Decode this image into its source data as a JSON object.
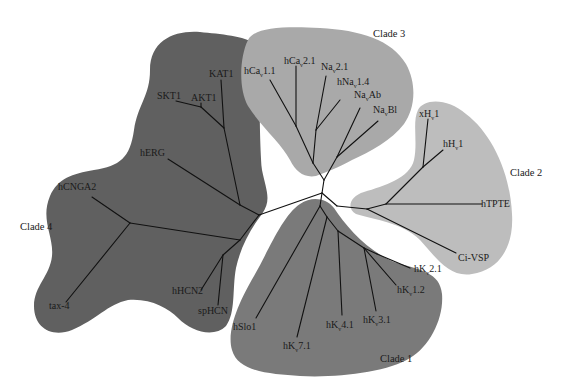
{
  "diagram": {
    "type": "unrooted phylogenetic tree",
    "colors": {
      "clade_1": "#7a7a7a",
      "clade_2": "#bdbdbd",
      "clade_3": "#a9a9a9",
      "clade_4": "#606060",
      "branch": "#111111",
      "background": "#ffffff"
    },
    "clades": [
      {
        "id": "clade_1",
        "label": "Clade 1",
        "leaves": [
          {
            "id": "hslo1",
            "base": "hSlo1",
            "sub": "",
            "rest": ""
          },
          {
            "id": "hkv7_1",
            "base": "hK",
            "sub": "v",
            "rest": "7.1"
          },
          {
            "id": "hkv4_1",
            "base": "hK",
            "sub": "v",
            "rest": "4.1"
          },
          {
            "id": "hkv3_1",
            "base": "hK",
            "sub": "v",
            "rest": "3.1"
          },
          {
            "id": "hkv1_2",
            "base": "hK",
            "sub": "v",
            "rest": "1.2"
          },
          {
            "id": "hkv2_1",
            "base": "hK",
            "sub": "v",
            "rest": "2.1"
          }
        ]
      },
      {
        "id": "clade_2",
        "label": "Clade 2",
        "leaves": [
          {
            "id": "xhv1",
            "base": "xH",
            "sub": "v",
            "rest": "1"
          },
          {
            "id": "hhv1",
            "base": "hH",
            "sub": "v",
            "rest": "1"
          },
          {
            "id": "htpte",
            "base": "hTPTE",
            "sub": "",
            "rest": ""
          },
          {
            "id": "civsp",
            "base": "Ci-VSP",
            "sub": "",
            "rest": ""
          }
        ]
      },
      {
        "id": "clade_3",
        "label": "Clade 3",
        "leaves": [
          {
            "id": "hcav1_1",
            "base": "hCa",
            "sub": "v",
            "rest": "1.1"
          },
          {
            "id": "hcav2_1",
            "base": "hCa",
            "sub": "v",
            "rest": "2.1"
          },
          {
            "id": "nav2_1",
            "base": "Na",
            "sub": "v",
            "rest": "2.1"
          },
          {
            "id": "hnav1_4",
            "base": "hNa",
            "sub": "v",
            "rest": "1.4"
          },
          {
            "id": "navab",
            "base": "Na",
            "sub": "v",
            "rest": "Ab"
          },
          {
            "id": "navbl",
            "base": "Na",
            "sub": "v",
            "rest": "Bl"
          }
        ]
      },
      {
        "id": "clade_4",
        "label": "Clade 4",
        "leaves": [
          {
            "id": "kat1",
            "base": "KAT1",
            "sub": "",
            "rest": ""
          },
          {
            "id": "skt1",
            "base": "SKT1",
            "sub": "",
            "rest": ""
          },
          {
            "id": "akt1",
            "base": "AKT1",
            "sub": "",
            "rest": ""
          },
          {
            "id": "herg",
            "base": "hERG",
            "sub": "",
            "rest": ""
          },
          {
            "id": "hcnga2",
            "base": "hCNGA2",
            "sub": "",
            "rest": ""
          },
          {
            "id": "tax4",
            "base": "tax-4",
            "sub": "",
            "rest": ""
          },
          {
            "id": "hhcn2",
            "base": "hHCN2",
            "sub": "",
            "rest": ""
          },
          {
            "id": "sphcn",
            "base": "spHCN",
            "sub": "",
            "rest": ""
          }
        ]
      }
    ]
  }
}
